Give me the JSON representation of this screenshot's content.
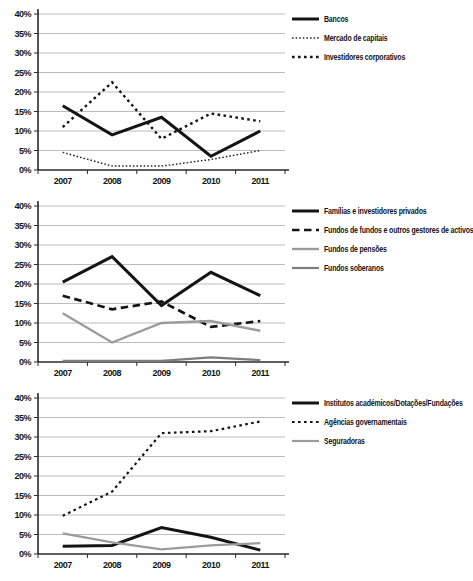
{
  "figure": {
    "background": "#ffffff",
    "grid_color": "#bdbdbd",
    "axis_color": "#2a2a2a",
    "black_line_color": "#141414",
    "gray_line_color": "#9c9c9c",
    "dark_gray_line_color": "#7d7d7d"
  },
  "axis_labels": {
    "y_ticks": [
      "40%",
      "35%",
      "30%",
      "25%",
      "20%",
      "15%",
      "10%",
      "5%",
      "0%"
    ],
    "x_ticks": [
      "2007",
      "2008",
      "2009",
      "2010",
      "2011"
    ]
  },
  "chart_data": [
    {
      "id": "chart-top",
      "type": "line",
      "title": "",
      "xlabel": "",
      "ylabel": "",
      "categories": [
        "2007",
        "2008",
        "2009",
        "2010",
        "2011"
      ],
      "ylim": [
        0,
        40
      ],
      "ystep": 5,
      "grid": true,
      "legend_position": "right",
      "series": [
        {
          "name": "Bancos",
          "style": "solid",
          "color": "#141414",
          "width": 3,
          "values": [
            16.5,
            9,
            13.5,
            3.5,
            10
          ]
        },
        {
          "name": "Mercado de capitais",
          "style": "dotted-fine",
          "color": "#2a2a2a",
          "width": 1.5,
          "values": [
            4.5,
            1,
            1,
            2.7,
            5
          ]
        },
        {
          "name": "Investidores corporativos",
          "style": "dotted-coarse",
          "color": "#141414",
          "width": 2.4,
          "values": [
            11,
            22.5,
            8,
            14.5,
            12.5
          ]
        }
      ]
    },
    {
      "id": "chart-middle",
      "type": "line",
      "title": "",
      "xlabel": "",
      "ylabel": "",
      "categories": [
        "2007",
        "2008",
        "2009",
        "2010",
        "2011"
      ],
      "ylim": [
        0,
        40
      ],
      "ystep": 5,
      "grid": true,
      "legend_position": "right",
      "series": [
        {
          "name": "Famílias e investidores privados",
          "style": "solid",
          "color": "#141414",
          "width": 3,
          "values": [
            20.5,
            27,
            14.5,
            23,
            17
          ]
        },
        {
          "name": "Fundos de fundos e outros gestores de activos",
          "style": "dashed",
          "color": "#141414",
          "width": 2.7,
          "values": [
            17,
            13.5,
            15.5,
            9,
            10.5
          ]
        },
        {
          "name": "Fundos de pensões",
          "style": "solid",
          "color": "#9c9c9c",
          "width": 2.4,
          "values": [
            12.5,
            5,
            10,
            10.5,
            8
          ]
        },
        {
          "name": "Fundos soberanos",
          "style": "solid",
          "color": "#7d7d7d",
          "width": 2.2,
          "values": [
            0.3,
            0.3,
            0.3,
            1.2,
            0.5
          ]
        }
      ]
    },
    {
      "id": "chart-bottom",
      "type": "line",
      "title": "",
      "xlabel": "",
      "ylabel": "",
      "categories": [
        "2007",
        "2008",
        "2009",
        "2010",
        "2011"
      ],
      "ylim": [
        0,
        40
      ],
      "ystep": 5,
      "grid": true,
      "legend_position": "right",
      "series": [
        {
          "name": "Institutos académicos/Dotações/Fundações",
          "style": "solid",
          "color": "#141414",
          "width": 3,
          "values": [
            2,
            2.2,
            6.8,
            4.3,
            1
          ]
        },
        {
          "name": "Agências governamentais",
          "style": "dotted-coarse",
          "color": "#141414",
          "width": 2.2,
          "values": [
            9.8,
            16,
            31,
            31.5,
            34
          ]
        },
        {
          "name": "Seguradoras",
          "style": "solid",
          "color": "#9c9c9c",
          "width": 2.2,
          "values": [
            5.3,
            3,
            1.2,
            2.2,
            2.8
          ]
        }
      ]
    }
  ]
}
